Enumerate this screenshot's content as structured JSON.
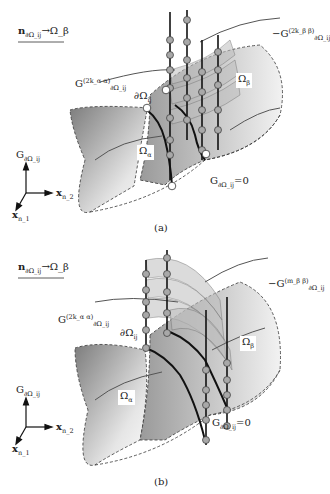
{
  "panels": [
    {
      "id": "a",
      "caption": "(a)",
      "legend": {
        "symbol": "n",
        "sub": "∂Ω_ij",
        "arrow": "→",
        "target": "Ω_β"
      },
      "labels": {
        "G_alpha": "G",
        "G_alpha_sup": "(2k_α α)",
        "G_alpha_sub": "∂Ω_ij",
        "boundary": "∂Ω",
        "boundary_sub": "ij",
        "G_beta": "−G",
        "G_beta_sup": "(2k_β β)",
        "G_beta_sub": "∂Ω_ij",
        "omega_alpha": "Ω",
        "omega_alpha_sub": "α",
        "omega_beta": "Ω",
        "omega_beta_sub": "β",
        "zero_G": "G",
        "zero_G_sub": "∂Ω_ij",
        "zero_eq": "=0"
      },
      "axes": {
        "vertical": "G",
        "vertical_sub": "∂Ω_ij",
        "x2": "x",
        "x2_sub": "n_2",
        "x1": "x",
        "x1_sub": "n_1"
      }
    },
    {
      "id": "b",
      "caption": "(b)",
      "legend": {
        "symbol": "n",
        "sub": "∂Ω_ij",
        "arrow": "→",
        "target": "Ω_β"
      },
      "labels": {
        "G_alpha": "G",
        "G_alpha_sup": "(2k_α α)",
        "G_alpha_sub": "∂Ω_ij",
        "boundary": "∂Ω",
        "boundary_sub": "ij",
        "G_beta": "−G",
        "G_beta_sup": "(m_β β)",
        "G_beta_sub": "∂Ω_ij",
        "omega_alpha": "Ω",
        "omega_alpha_sub": "α",
        "omega_beta": "Ω",
        "omega_beta_sub": "β",
        "zero_G": "G",
        "zero_G_sub": "∂Ω_ij",
        "zero_eq": "=0"
      },
      "axes": {
        "vertical": "G",
        "vertical_sub": "∂Ω_ij",
        "x2": "x",
        "x2_sub": "n_2",
        "x1": "x",
        "x1_sub": "n_1"
      }
    }
  ],
  "colors": {
    "region_dark": "#8a8a8a",
    "region_light": "#f0f0f0",
    "node_fill": "#a8a8a8",
    "node_open": "#ffffff",
    "line": "#111111"
  }
}
